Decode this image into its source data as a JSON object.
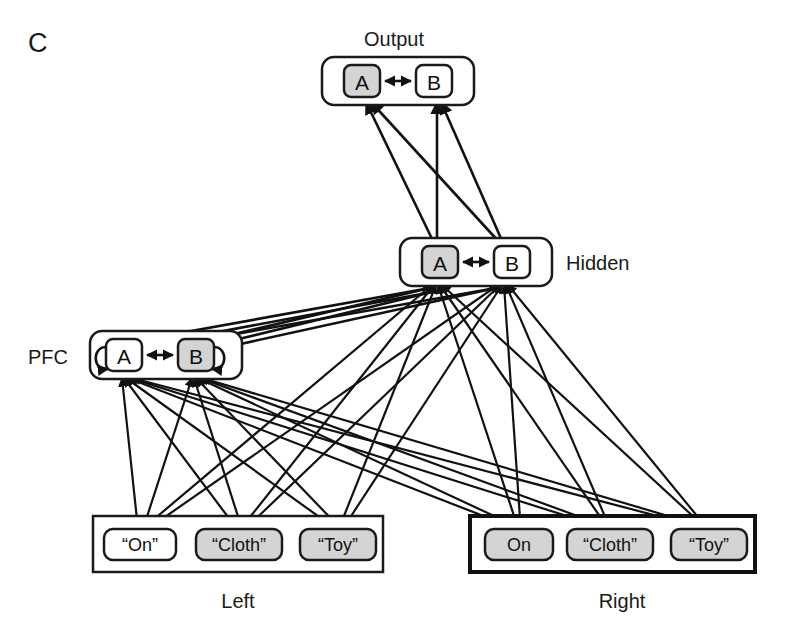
{
  "figure": {
    "panel_label": "C",
    "width": 789,
    "height": 637
  },
  "layers": {
    "output": {
      "label": "Output",
      "label_position": "above",
      "nodes": [
        {
          "name": "A",
          "shaded": true
        },
        {
          "name": "B",
          "shaded": false
        }
      ],
      "lateral_connection": "bidirectional"
    },
    "hidden": {
      "label": "Hidden",
      "label_position": "right",
      "nodes": [
        {
          "name": "A",
          "shaded": true
        },
        {
          "name": "B",
          "shaded": false
        }
      ],
      "lateral_connection": "bidirectional"
    },
    "pfc": {
      "label": "PFC",
      "label_position": "left",
      "nodes": [
        {
          "name": "A",
          "shaded": false,
          "self_recurrent": true
        },
        {
          "name": "B",
          "shaded": true,
          "self_recurrent": true
        }
      ],
      "lateral_connection": "bidirectional"
    }
  },
  "input_groups": [
    {
      "label": "Left",
      "border": "thin",
      "nodes": [
        {
          "name": "“On”",
          "shaded": false
        },
        {
          "name": "“Cloth”",
          "shaded": true
        },
        {
          "name": "“Toy”",
          "shaded": true
        }
      ]
    },
    {
      "label": "Right",
      "border": "thick",
      "nodes": [
        {
          "name": "On",
          "shaded": true
        },
        {
          "name": "“Cloth”",
          "shaded": true
        },
        {
          "name": "“Toy”",
          "shaded": true
        }
      ]
    }
  ],
  "colors": {
    "shaded_fill": "#d4d4d4",
    "white_fill": "#ffffff",
    "stroke": "#1a1a1a",
    "background": "#ffffff"
  },
  "connection_sets": [
    {
      "from": "hidden",
      "to": "output",
      "style": "full-bipartite-arrowed"
    },
    {
      "from": "pfc",
      "to": "hidden",
      "style": "full-bipartite-arrowed"
    },
    {
      "from": "inputs",
      "to": "hidden",
      "style": "full-bipartite-arrowed"
    },
    {
      "from": "inputs",
      "to": "pfc",
      "style": "full-bipartite-arrowed"
    }
  ]
}
